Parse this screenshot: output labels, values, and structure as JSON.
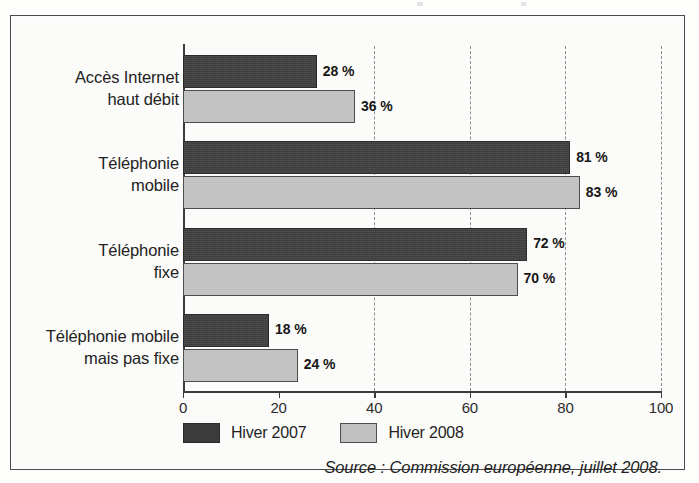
{
  "chart_data": {
    "type": "bar",
    "orientation": "horizontal",
    "categories": [
      "Accès Internet\nhaut débit",
      "Téléphonie\nmobile",
      "Téléphonie\nfixe",
      "Téléphonie mobile\nmais pas fixe"
    ],
    "category_lines": [
      [
        "Accès Internet",
        "haut débit"
      ],
      [
        "Téléphonie",
        "mobile"
      ],
      [
        "Téléphonie",
        "fixe"
      ],
      [
        "Téléphonie mobile",
        "mais pas fixe"
      ]
    ],
    "series": [
      {
        "name": "Hiver 2007",
        "color": "#3b3b3b",
        "values": [
          28,
          81,
          72,
          18
        ],
        "labels": [
          "28 %",
          "81 %",
          "72 %",
          "18 %"
        ]
      },
      {
        "name": "Hiver 2008",
        "color": "#c0c0c0",
        "values": [
          36,
          83,
          70,
          24
        ],
        "labels": [
          "36 %",
          "83 %",
          "70 %",
          "24 %"
        ]
      }
    ],
    "title": "",
    "xlabel": "",
    "ylabel": "",
    "xlim": [
      0,
      100
    ],
    "xticks": [
      0,
      20,
      40,
      60,
      80,
      100
    ],
    "xtick_labels": [
      "0",
      "20",
      "40",
      "60",
      "80",
      "100"
    ],
    "gridlines_at": [
      40,
      60,
      80,
      100
    ],
    "grid": true,
    "legend_position": "bottom-left",
    "unit": "%"
  },
  "legend": {
    "items": [
      {
        "label": "Hiver 2007",
        "color": "#3b3b3b"
      },
      {
        "label": "Hiver 2008",
        "color": "#c0c0c0"
      }
    ]
  },
  "source": {
    "text": "Source : Commission européenne, juillet 2008."
  },
  "colors": {
    "series_2007": "#3b3b3b",
    "series_2008": "#c0c0c0",
    "axis": "#3c3c3c",
    "grid": "#8f8f8f",
    "frame": "#4a4a4a",
    "background": "#fbfbf9",
    "text": "#1f1f1f"
  }
}
